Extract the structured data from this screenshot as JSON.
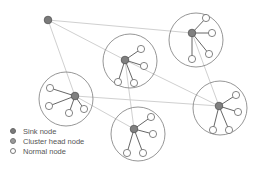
{
  "diagram": {
    "colors": {
      "sink": "#7a7a7a",
      "head": "#808080",
      "normal": "#ffffff",
      "stroke": "#666666",
      "link": "#d0d0d0"
    },
    "sink": {
      "id": "sink",
      "label": "Sink node"
    },
    "clusters": [
      {
        "id": "c1",
        "normal_count": 4
      },
      {
        "id": "c2",
        "normal_count": 4
      },
      {
        "id": "c3",
        "normal_count": 4
      },
      {
        "id": "c4",
        "normal_count": 4
      },
      {
        "id": "c5",
        "normal_count": 4
      }
    ],
    "links": [
      [
        "sink",
        "c1"
      ],
      [
        "sink",
        "c2"
      ],
      [
        "sink",
        "c3"
      ],
      [
        "c2",
        "c4"
      ],
      [
        "c2",
        "c5"
      ],
      [
        "c1",
        "c5"
      ],
      [
        "c3",
        "c5"
      ],
      [
        "c3",
        "c4"
      ]
    ]
  },
  "legend": {
    "items": [
      {
        "label": "Sink node",
        "kind": "sink"
      },
      {
        "label": "Cluster head node",
        "kind": "head"
      },
      {
        "label": "Normal node",
        "kind": "normal"
      }
    ]
  }
}
